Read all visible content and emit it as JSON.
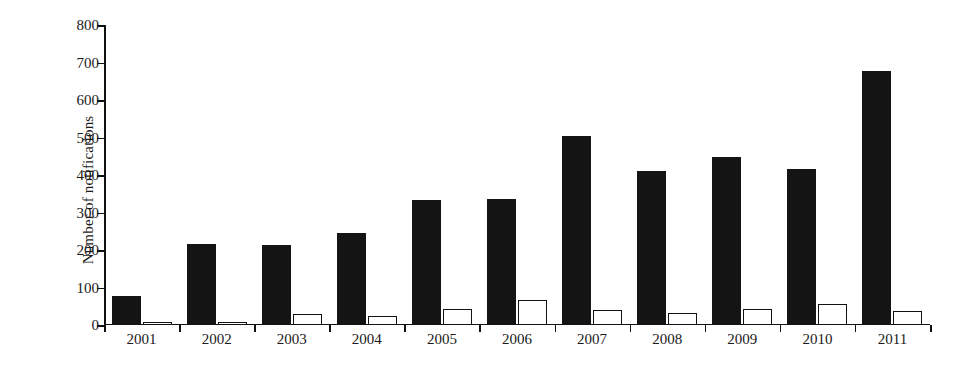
{
  "chart_data": {
    "type": "bar",
    "title": "",
    "xlabel": "",
    "ylabel": "Number of notifications",
    "categories": [
      "2001",
      "2002",
      "2003",
      "2004",
      "2005",
      "2006",
      "2007",
      "2008",
      "2009",
      "2010",
      "2011"
    ],
    "series": [
      {
        "name": "dark",
        "color": "#141414",
        "values": [
          78,
          216,
          214,
          246,
          334,
          335,
          503,
          410,
          448,
          415,
          678
        ]
      },
      {
        "name": "light",
        "color": "#ffffff",
        "values": [
          8,
          9,
          30,
          25,
          42,
          68,
          40,
          32,
          44,
          55,
          38
        ]
      }
    ],
    "ylim": [
      0,
      800
    ],
    "yticks": [
      0,
      100,
      200,
      300,
      400,
      500,
      600,
      700,
      800
    ],
    "ytick_labels": [
      "0",
      "100",
      "200",
      "300",
      "400",
      "500",
      "600",
      "700",
      "800"
    ],
    "grid": false,
    "legend": "none"
  }
}
